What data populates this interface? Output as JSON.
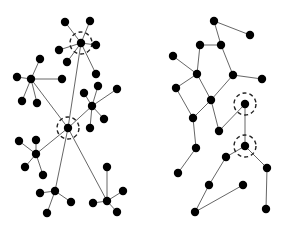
{
  "diagram": {
    "title": "",
    "colors": {
      "node": "#000000",
      "edge": "#555555",
      "highlight": "#222222",
      "background": "#ffffff"
    },
    "networks": [
      {
        "name": "left-network",
        "nodes": [
          {
            "id": "A",
            "highlighted": true
          },
          {
            "id": "A1"
          },
          {
            "id": "A2"
          },
          {
            "id": "A3"
          },
          {
            "id": "A4"
          },
          {
            "id": "A5"
          },
          {
            "id": "A6"
          },
          {
            "id": "B"
          },
          {
            "id": "B1"
          },
          {
            "id": "B2"
          },
          {
            "id": "B3"
          },
          {
            "id": "B4"
          },
          {
            "id": "B5"
          },
          {
            "id": "C",
            "highlighted": true
          },
          {
            "id": "D"
          },
          {
            "id": "D1"
          },
          {
            "id": "D2"
          },
          {
            "id": "D3"
          },
          {
            "id": "D4"
          },
          {
            "id": "D5"
          },
          {
            "id": "E"
          },
          {
            "id": "E1"
          },
          {
            "id": "E2"
          },
          {
            "id": "E3"
          },
          {
            "id": "E4"
          },
          {
            "id": "F"
          },
          {
            "id": "F1"
          },
          {
            "id": "F2"
          },
          {
            "id": "F3"
          },
          {
            "id": "G"
          },
          {
            "id": "G1"
          },
          {
            "id": "G2"
          },
          {
            "id": "G3"
          },
          {
            "id": "G4"
          }
        ],
        "edges": [
          [
            "A",
            "A1"
          ],
          [
            "A",
            "A2"
          ],
          [
            "A",
            "A3"
          ],
          [
            "A",
            "A4"
          ],
          [
            "A",
            "A5"
          ],
          [
            "A",
            "A6"
          ],
          [
            "B",
            "B1"
          ],
          [
            "B",
            "B2"
          ],
          [
            "B",
            "B3"
          ],
          [
            "B",
            "B4"
          ],
          [
            "B",
            "B5"
          ],
          [
            "A",
            "C"
          ],
          [
            "B",
            "C"
          ],
          [
            "C",
            "D"
          ],
          [
            "D",
            "D1"
          ],
          [
            "D",
            "D2"
          ],
          [
            "D",
            "D3"
          ],
          [
            "D",
            "D4"
          ],
          [
            "D",
            "D5"
          ],
          [
            "C",
            "E"
          ],
          [
            "E",
            "E1"
          ],
          [
            "E",
            "E2"
          ],
          [
            "E",
            "E3"
          ],
          [
            "E",
            "E4"
          ],
          [
            "C",
            "F"
          ],
          [
            "F",
            "F1"
          ],
          [
            "F",
            "F2"
          ],
          [
            "F",
            "F3"
          ],
          [
            "C",
            "G"
          ],
          [
            "G",
            "G1"
          ],
          [
            "G",
            "G2"
          ],
          [
            "G",
            "G3"
          ],
          [
            "G",
            "G4"
          ]
        ]
      },
      {
        "name": "right-network",
        "nodes": [
          {
            "id": "R1"
          },
          {
            "id": "R2"
          },
          {
            "id": "R3"
          },
          {
            "id": "R4"
          },
          {
            "id": "R5"
          },
          {
            "id": "R6"
          },
          {
            "id": "R7"
          },
          {
            "id": "R8"
          },
          {
            "id": "R9"
          },
          {
            "id": "R10"
          },
          {
            "id": "R11"
          },
          {
            "id": "R12"
          },
          {
            "id": "R13"
          },
          {
            "id": "R14",
            "highlighted": true
          },
          {
            "id": "R15",
            "highlighted": true
          },
          {
            "id": "R16"
          },
          {
            "id": "R17"
          },
          {
            "id": "R18"
          },
          {
            "id": "R19"
          },
          {
            "id": "R20"
          },
          {
            "id": "R21"
          },
          {
            "id": "R22"
          }
        ],
        "edges": [
          [
            "R1",
            "R2"
          ],
          [
            "R1",
            "R3"
          ],
          [
            "R4",
            "R3"
          ],
          [
            "R5",
            "R6"
          ],
          [
            "R4",
            "R6"
          ],
          [
            "R3",
            "R7"
          ],
          [
            "R7",
            "R8"
          ],
          [
            "R6",
            "R9"
          ],
          [
            "R6",
            "R10"
          ],
          [
            "R7",
            "R10"
          ],
          [
            "R9",
            "R11"
          ],
          [
            "R10",
            "R11"
          ],
          [
            "R10",
            "R12"
          ],
          [
            "R11",
            "R13"
          ],
          [
            "R12",
            "R14"
          ],
          [
            "R14",
            "R15"
          ],
          [
            "R15",
            "R16"
          ],
          [
            "R15",
            "R17"
          ],
          [
            "R13",
            "R18"
          ],
          [
            "R16",
            "R19"
          ],
          [
            "R19",
            "R20"
          ],
          [
            "R20",
            "R21"
          ],
          [
            "R17",
            "R22"
          ]
        ]
      }
    ]
  }
}
